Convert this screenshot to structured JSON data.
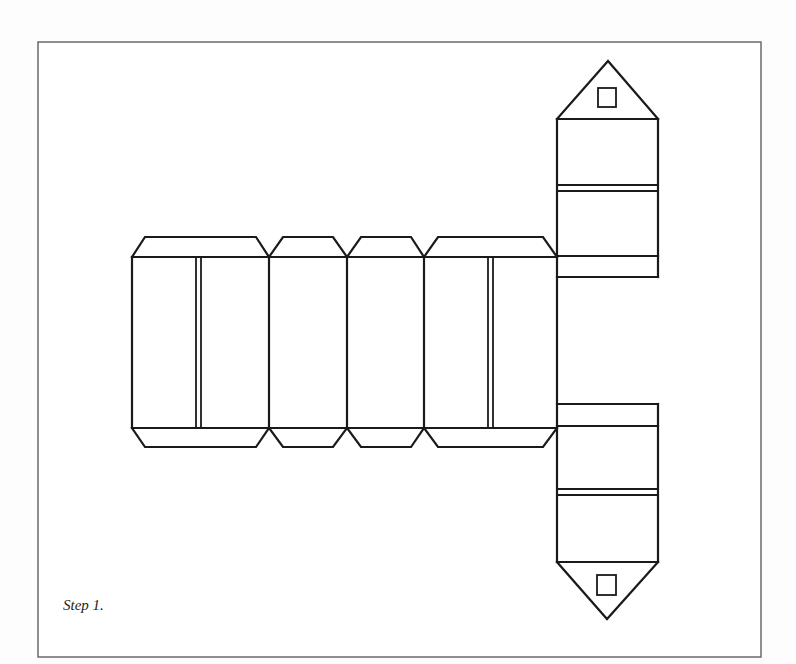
{
  "figure": {
    "caption": "Step 1.",
    "colors": {
      "background": "#fdfdfd",
      "frame_stroke": "#6a6a6a",
      "line_color": "#1a1a1a"
    },
    "parts": {
      "wall_panels": [
        "large-wall-left",
        "narrow-wall-1",
        "narrow-wall-2",
        "large-wall-right"
      ],
      "gables": [
        "gable-top",
        "gable-bottom"
      ],
      "windows": [
        "window-top",
        "window-bottom"
      ]
    }
  }
}
